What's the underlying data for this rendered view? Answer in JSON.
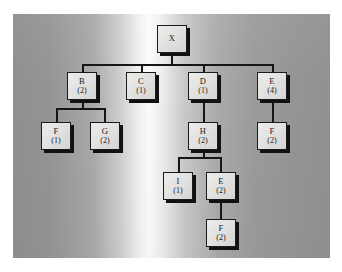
{
  "diagram": {
    "background": {
      "panel_color_light": "#fbfbfb",
      "panel_color_dark": "#8f8f8f",
      "page_color": "#ffffff"
    },
    "node_style": {
      "fill": "#e6e6e5",
      "border": "#1b1b1b",
      "shadow": "#111111",
      "text": "#1a1a1a"
    },
    "nodes": [
      {
        "id": "x",
        "label": "X",
        "count": "",
        "x": 157,
        "y": 25
      },
      {
        "id": "b",
        "label": "B",
        "count": "(2)",
        "x": 67,
        "y": 72
      },
      {
        "id": "c",
        "label": "C",
        "count": "(1)",
        "x": 126,
        "y": 72
      },
      {
        "id": "d",
        "label": "D",
        "count": "(1)",
        "x": 188,
        "y": 72
      },
      {
        "id": "e1",
        "label": "E",
        "count": "(4)",
        "x": 257,
        "y": 72
      },
      {
        "id": "f1",
        "label": "F",
        "count": "(1)",
        "x": 41,
        "y": 122
      },
      {
        "id": "g",
        "label": "G",
        "count": "(2)",
        "x": 90,
        "y": 122
      },
      {
        "id": "h",
        "label": "H",
        "count": "(2)",
        "x": 188,
        "y": 122
      },
      {
        "id": "f2",
        "label": "F",
        "count": "(2)",
        "x": 257,
        "y": 122
      },
      {
        "id": "i",
        "label": "I",
        "count": "(1)",
        "x": 163,
        "y": 172
      },
      {
        "id": "e2",
        "label": "E",
        "count": "(2)",
        "x": 206,
        "y": 172
      },
      {
        "id": "f3",
        "label": "F",
        "count": "(2)",
        "x": 206,
        "y": 219
      }
    ],
    "edges": [
      {
        "from": "x",
        "to": "b"
      },
      {
        "from": "x",
        "to": "c"
      },
      {
        "from": "x",
        "to": "d"
      },
      {
        "from": "x",
        "to": "e1"
      },
      {
        "from": "b",
        "to": "f1"
      },
      {
        "from": "b",
        "to": "g"
      },
      {
        "from": "d",
        "to": "h"
      },
      {
        "from": "e1",
        "to": "f2"
      },
      {
        "from": "h",
        "to": "i"
      },
      {
        "from": "h",
        "to": "e2"
      },
      {
        "from": "e2",
        "to": "f3"
      }
    ]
  }
}
